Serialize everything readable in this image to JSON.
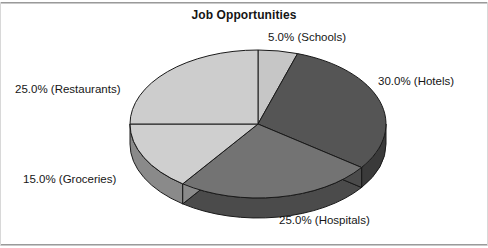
{
  "chart_data": {
    "type": "pie",
    "title": "Job Opportunities",
    "xlabel": "",
    "ylabel": "",
    "legend_position": "none",
    "grid": false,
    "categories": [
      "Schools",
      "Hotels",
      "Hospitals",
      "Groceries",
      "Restaurants"
    ],
    "values": [
      5.0,
      30.0,
      25.0,
      15.0,
      25.0
    ],
    "value_unit": "%",
    "start_angle_deg": 0,
    "direction": "clockwise",
    "three_d": true,
    "slices": [
      {
        "label": "Schools",
        "value": 5.0,
        "data_label": "5.0% (Schools)",
        "color": "#c6c6c6",
        "side_color": "#8e8e8e"
      },
      {
        "label": "Hotels",
        "value": 30.0,
        "data_label": "30.0% (Hotels)",
        "color": "#555555",
        "side_color": "#3a3a3a"
      },
      {
        "label": "Hospitals",
        "value": 25.0,
        "data_label": "25.0% (Hospitals)",
        "color": "#737373",
        "side_color": "#4b4b4b"
      },
      {
        "label": "Groceries",
        "value": 15.0,
        "data_label": "15.0% (Groceries)",
        "color": "#cfcfcf",
        "side_color": "#8a8a8a"
      },
      {
        "label": "Restaurants",
        "value": 25.0,
        "data_label": "25.0% (Restaurants)",
        "color": "#cdcdcd",
        "side_color": "#8a8a8a"
      }
    ],
    "outline_color": "#1a1a1a",
    "background": "#ffffff"
  },
  "labels": {
    "schools": "5.0% (Schools)",
    "hotels": "30.0% (Hotels)",
    "hospitals": "25.0% (Hospitals)",
    "groceries": "15.0% (Groceries)",
    "restaurants": "25.0% (Restaurants)"
  }
}
